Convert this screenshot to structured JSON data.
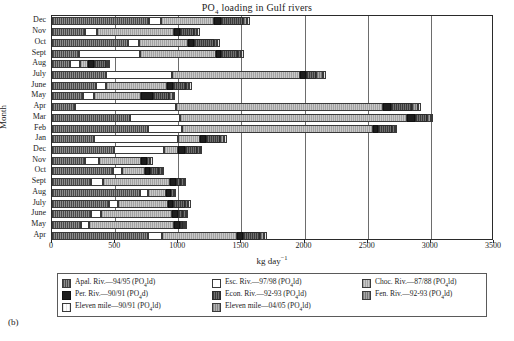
{
  "panel_label": "(b)",
  "chart_data": {
    "type": "bar",
    "orientation": "horizontal",
    "stacked": true,
    "title": "PO4 loading in Gulf rivers",
    "title_html": "PO<sub>4</sub> loading in Gulf rivers",
    "xlabel": "kg day-1",
    "xlabel_html": "kg day<sup>−1</sup>",
    "ylabel": "Month",
    "xlim": [
      0,
      3500
    ],
    "xticks": [
      0,
      500,
      1000,
      1500,
      2000,
      2500,
      3000,
      3500
    ],
    "xticklabels": [
      "0",
      "500",
      "1000",
      "1500",
      "2000",
      "2500",
      "3000",
      "3500"
    ],
    "grid": true,
    "grid_axis": "x",
    "legend_position": "below",
    "categories": [
      "Dec",
      "Nov",
      "Oct",
      "Sept",
      "Aug",
      "July",
      "June",
      "May",
      "Apr",
      "Mar",
      "Feb",
      "Jan",
      "Dec",
      "Nov",
      "Oct",
      "Sept",
      "Aug",
      "July",
      "June",
      "May",
      "Apr"
    ],
    "series": [
      {
        "name": "Apal. Riv.—94/95 (PO4ld)",
        "key": "apal",
        "values": [
          770,
          265,
          600,
          215,
          140,
          425,
          350,
          245,
          185,
          620,
          760,
          330,
          490,
          265,
          480,
          305,
          700,
          455,
          310,
          230,
          760
        ]
      },
      {
        "name": "Esc. Riv.—97/98 (PO4ld)",
        "key": "esc",
        "values": [
          95,
          95,
          90,
          480,
          85,
          525,
          80,
          90,
          800,
          395,
          270,
          670,
          400,
          110,
          75,
          100,
          60,
          70,
          80,
          60,
          110
        ]
      },
      {
        "name": "Choc. Riv.—87/88 (PO4ld)",
        "key": "choc",
        "values": [
          420,
          610,
          390,
          600,
          60,
          1010,
          480,
          370,
          1640,
          1800,
          1510,
          170,
          110,
          330,
          180,
          530,
          145,
          390,
          560,
          680,
          595
        ]
      },
      {
        "name": "Per. Riv.—90/91 (PO4d)",
        "key": "per",
        "values": [
          55,
          45,
          45,
          40,
          50,
          50,
          50,
          95,
          60,
          60,
          40,
          50,
          50,
          50,
          45,
          45,
          40,
          45,
          45,
          45,
          50
        ]
      },
      {
        "name": "Econ. Riv.—92-93 (PO4ld)",
        "key": "econ",
        "values": [
          170,
          110,
          155,
          135,
          90,
          80,
          100,
          130,
          170,
          95,
          110,
          110,
          95,
          0,
          70,
          40,
          0,
          95,
          40,
          20,
          135
        ]
      },
      {
        "name": "Fen. Riv.—92-93 (PO4ld)",
        "key": "fen",
        "values": [
          35,
          25,
          30,
          30,
          20,
          55,
          25,
          25,
          40,
          30,
          25,
          35,
          25,
          25,
          25,
          25,
          20,
          25,
          25,
          20,
          30
        ]
      },
      {
        "name": "Eleven mile—90/91 (PO4ld)",
        "key": "elev90",
        "values": [
          20,
          20,
          20,
          20,
          15,
          25,
          20,
          20,
          25,
          20,
          20,
          20,
          20,
          20,
          15,
          15,
          15,
          20,
          15,
          15,
          20
        ]
      },
      {
        "name": "Eleven mile—04/05 (PO4ld)",
        "key": "elev04",
        "values": [
          0,
          0,
          0,
          0,
          0,
          0,
          0,
          0,
          0,
          0,
          0,
          0,
          0,
          0,
          0,
          0,
          0,
          0,
          0,
          0,
          0
        ]
      }
    ]
  },
  "legend": {
    "entries": [
      {
        "key": "apal",
        "label": "Apal. Riv.—94/95 (PO",
        "sub": "4",
        "tail": "ld)"
      },
      {
        "key": "esc",
        "label": "Esc. Riv.—97/98 (PO",
        "sub": "4",
        "tail": "ld)"
      },
      {
        "key": "choc",
        "label": "Choc. Riv.—87/88 (PO",
        "sub": "4",
        "tail": "ld)"
      },
      {
        "key": "per",
        "label": "Per. Riv.—90/91 (PO",
        "sub": "4",
        "tail": "d)"
      },
      {
        "key": "econ",
        "label": "Econ. Riv.—92-93 (PO",
        "sub": "4",
        "tail": "ld)"
      },
      {
        "key": "fen",
        "label": "Fen. Riv.—92-93 (PO",
        "sub": "4",
        "tail": "ld)"
      },
      {
        "key": "elev90",
        "label": "Eleven mile—90/91 (PO",
        "sub": "4",
        "tail": "ld)"
      },
      {
        "key": "elev04",
        "label": "Eleven mile—04/05 (PO",
        "sub": "4",
        "tail": "ld)"
      }
    ],
    "order": [
      "apal",
      "esc",
      "choc",
      "per",
      "econ",
      "fen",
      "elev90",
      "elev04"
    ]
  },
  "colors": {
    "apal": "#6e6e6e",
    "esc": "#ffffff",
    "choc": "#b6b6b6",
    "per": "#1e1e1e",
    "econ": "#585858",
    "fen": "#8f8f8f",
    "elev90": "#fbfbfb",
    "elev04": "#9c9c9c",
    "axis": "#2a2a2a",
    "grid": "#6d6d6d"
  }
}
